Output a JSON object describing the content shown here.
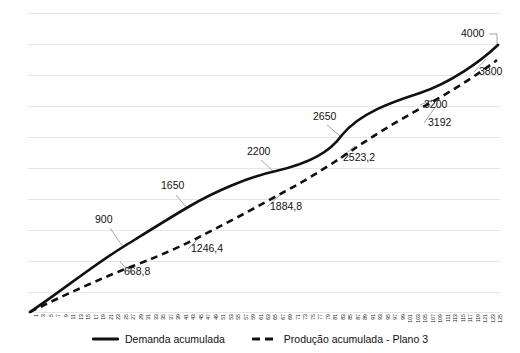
{
  "chart_data": {
    "type": "line",
    "title": "",
    "subtitle": "",
    "xlabel": "",
    "ylabel": "",
    "grid": true,
    "legend_position": "bottom",
    "xlim": [
      1,
      125
    ],
    "ylim": [
      0,
      4400
    ],
    "gridline_count": 11,
    "x": [
      1,
      3,
      5,
      7,
      9,
      11,
      13,
      15,
      17,
      19,
      21,
      23,
      25,
      27,
      29,
      31,
      33,
      35,
      37,
      39,
      41,
      43,
      45,
      47,
      49,
      51,
      53,
      55,
      57,
      59,
      61,
      63,
      65,
      67,
      69,
      71,
      73,
      75,
      77,
      79,
      81,
      83,
      85,
      87,
      89,
      91,
      93,
      95,
      97,
      99,
      101,
      103,
      105,
      107,
      109,
      111,
      113,
      115,
      117,
      119,
      121,
      123,
      125
    ],
    "xtick_labels": [
      "1",
      "3",
      "5",
      "7",
      "9",
      "11",
      "13",
      "15",
      "17",
      "19",
      "21",
      "23",
      "25",
      "27",
      "29",
      "31",
      "33",
      "35",
      "37",
      "39",
      "41",
      "43",
      "45",
      "47",
      "49",
      "51",
      "53",
      "55",
      "57",
      "59",
      "61",
      "63",
      "65",
      "67",
      "69",
      "71",
      "73",
      "75",
      "77",
      "79",
      "81",
      "83",
      "85",
      "87",
      "89",
      "91",
      "93",
      "95",
      "97",
      "99",
      "101",
      "103",
      "105",
      "107",
      "109",
      "111",
      "113",
      "115",
      "117",
      "119",
      "121",
      "123",
      "125"
    ],
    "series": [
      {
        "name": "Demanda acumulada",
        "style": "solid",
        "color": "#111111",
        "knots_x": [
          1,
          21,
          41,
          61,
          81,
          103,
          125
        ],
        "knots_y": [
          0,
          900,
          1650,
          2200,
          2650,
          3200,
          4000
        ]
      },
      {
        "name": "Produção acumulada - Plano 3",
        "style": "dashed",
        "color": "#111111",
        "knots_x": [
          1,
          21,
          41,
          61,
          81,
          103,
          125
        ],
        "knots_y": [
          0,
          668.8,
          1246.4,
          1884.8,
          2523.2,
          3192,
          3800
        ]
      }
    ],
    "annotations": [
      {
        "text": "900",
        "series": "Demanda acumulada",
        "value": 900
      },
      {
        "text": "1650",
        "series": "Demanda acumulada",
        "value": 1650
      },
      {
        "text": "2200",
        "series": "Demanda acumulada",
        "value": 2200
      },
      {
        "text": "2650",
        "series": "Demanda acumulada",
        "value": 2650
      },
      {
        "text": "3200",
        "series": "Demanda acumulada",
        "value": 3200
      },
      {
        "text": "4000",
        "series": "Demanda acumulada",
        "value": 4000
      },
      {
        "text": "668,8",
        "series": "Produção acumulada - Plano 3",
        "value": 668.8
      },
      {
        "text": "1246,4",
        "series": "Produção acumulada - Plano 3",
        "value": 1246.4
      },
      {
        "text": "1884,8",
        "series": "Produção acumulada - Plano 3",
        "value": 1884.8
      },
      {
        "text": "2523,2",
        "series": "Produção acumulada - Plano 3",
        "value": 2523.2
      },
      {
        "text": "3192",
        "series": "Produção acumulada - Plano 3",
        "value": 3192
      },
      {
        "text": "3800",
        "series": "Produção acumulada - Plano 3",
        "value": 3800
      }
    ]
  },
  "legend": {
    "items": [
      {
        "label": "Demanda acumulada",
        "style": "solid"
      },
      {
        "label": "Produção acumulada - Plano 3",
        "style": "dashed"
      }
    ]
  },
  "colors": {
    "series_line": "#111111",
    "gridline": "#e6e6e6",
    "text": "#111111",
    "leader": "#9a9a9a",
    "background": "#ffffff"
  }
}
